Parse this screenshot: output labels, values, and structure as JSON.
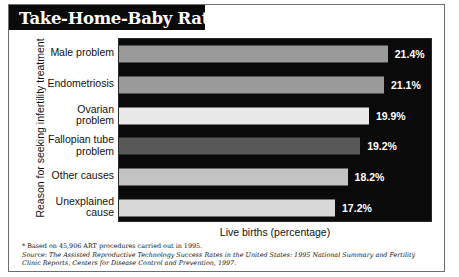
{
  "title": {
    "text": "Take-Home-Baby Rates",
    "footnote_marker": "*"
  },
  "chart_data": {
    "type": "bar",
    "orientation": "horizontal",
    "title": "Take-Home-Baby Rates*",
    "xlabel": "Live births (percentage)",
    "ylabel": "Reason for seeking infertility treatment",
    "xlim": [
      0,
      25
    ],
    "grid": false,
    "legend": "none",
    "categories": [
      "Male problem",
      "Endometriosis",
      "Ovarian problem",
      "Fallopian tube problem",
      "Other causes",
      "Unexplained cause"
    ],
    "category_lines": [
      [
        "Male problem"
      ],
      [
        "Endometriosis"
      ],
      [
        "Ovarian",
        "problem"
      ],
      [
        "Fallopian tube",
        "problem"
      ],
      [
        "Other causes"
      ],
      [
        "Unexplained",
        "cause"
      ]
    ],
    "values": [
      21.4,
      21.1,
      19.9,
      19.2,
      18.2,
      17.2
    ],
    "value_labels": [
      "21.4%",
      "21.1%",
      "19.9%",
      "19.2%",
      "18.2%",
      "17.2%"
    ],
    "bar_colors": [
      "#9a9a9a",
      "#9a9a9a",
      "#e8e8e8",
      "#585858",
      "#c3c3c3",
      "#d8d8d8"
    ],
    "plot_background": "#0a0a0a",
    "value_label_color": "#ffffff"
  },
  "notes": {
    "footnote": "* Based on 45,906 ART procedures carried out in 1995.",
    "source_label": "Source:",
    "source_line1": "The Assisted Reproductive Technology Success Rates in the United States: 1995 National Summary and Fertility",
    "source_line2": "Clinic Reports, Centers for Disease Control and Prevention, 1997."
  }
}
